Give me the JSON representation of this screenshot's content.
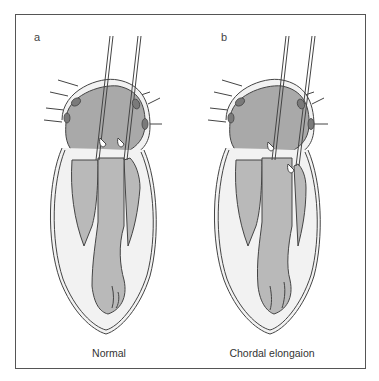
{
  "figure": {
    "panels": [
      {
        "label": "a",
        "caption": "Normal"
      },
      {
        "label": "b",
        "caption": "Chordal elongaion"
      }
    ]
  },
  "colors": {
    "frame": "#555555",
    "atrium_fill": "#a9a9a9",
    "ventricle_fill": "#b9b9b9",
    "wall_fill": "#f2f2f2",
    "outline": "#444444",
    "vein_ovals": "#7a7a7a"
  }
}
